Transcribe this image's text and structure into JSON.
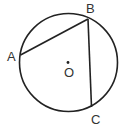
{
  "diagram": {
    "type": "geometry-circle",
    "circle": {
      "cx": 68.5,
      "cy": 62.5,
      "r": 49,
      "stroke": "#222222"
    },
    "center": {
      "label": "O",
      "x": 68,
      "y": 63
    },
    "points": [
      {
        "label": "A",
        "x": 20.5,
        "y": 55
      },
      {
        "label": "B",
        "x": 88,
        "y": 19
      },
      {
        "label": "C",
        "x": 91.5,
        "y": 107
      }
    ],
    "chords": [
      [
        "A",
        "B"
      ],
      [
        "B",
        "C"
      ]
    ]
  }
}
